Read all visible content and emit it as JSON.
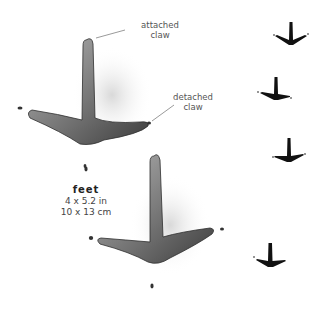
{
  "annotations": {
    "attached_claw": [
      "attached",
      "claw"
    ],
    "detached_claw": [
      "detached",
      "claw"
    ]
  },
  "caption": {
    "title": "feet",
    "size_imperial": "4 x 5.2 in",
    "size_metric": "10 x 13 cm"
  },
  "colors": {
    "track_fill": "#8a8a8a",
    "track_shadow": "#3a3a3a",
    "trail_mark": "#111111",
    "label_text": "#555555"
  },
  "trail": {
    "marks": 4
  }
}
